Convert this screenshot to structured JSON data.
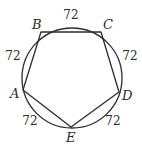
{
  "diagram": {
    "type": "inscribed-pentagon",
    "circle": {
      "cx": 72,
      "cy": 78,
      "r": 50
    },
    "vertices": [
      {
        "id": "A",
        "label": "A",
        "x": 23,
        "y": 90,
        "label_x": 10,
        "label_y": 98
      },
      {
        "id": "B",
        "label": "B",
        "x": 41,
        "y": 32,
        "label_x": 32,
        "label_y": 29
      },
      {
        "id": "C",
        "label": "C",
        "x": 101,
        "y": 32,
        "label_x": 103,
        "label_y": 29
      },
      {
        "id": "D",
        "label": "D",
        "x": 119,
        "y": 92,
        "label_x": 122,
        "label_y": 100
      },
      {
        "id": "E",
        "label": "E",
        "x": 71,
        "y": 127,
        "label_x": 66,
        "label_y": 142
      }
    ],
    "arcs": [
      {
        "from": "B",
        "to": "C",
        "measure": "72",
        "x": 71,
        "y": 19
      },
      {
        "from": "A",
        "to": "B",
        "measure": "72",
        "x": 13,
        "y": 60
      },
      {
        "from": "C",
        "to": "D",
        "measure": "72",
        "x": 130,
        "y": 60
      },
      {
        "from": "A",
        "to": "E",
        "measure": "72",
        "x": 30,
        "y": 125
      },
      {
        "from": "D",
        "to": "E",
        "measure": "72",
        "x": 113,
        "y": 125
      }
    ],
    "stroke_color": "#2b2b2b",
    "background": "#ffffff"
  }
}
